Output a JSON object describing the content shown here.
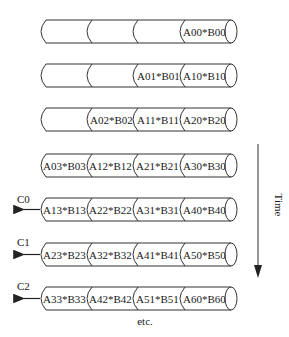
{
  "diagram": {
    "title": "",
    "rows": [
      {
        "output": "",
        "segments": [
          "",
          "",
          "",
          "A00*B00"
        ]
      },
      {
        "output": "",
        "segments": [
          "",
          "",
          "A01*B01",
          "A10*B10"
        ]
      },
      {
        "output": "",
        "segments": [
          "",
          "A02*B02",
          "A11*B11",
          "A20*B20"
        ]
      },
      {
        "output": "",
        "segments": [
          "A03*B03",
          "A12*B12",
          "A21*B21",
          "A30*B30"
        ]
      },
      {
        "output": "C0",
        "segments": [
          "A13*B13",
          "A22*B22",
          "A31*B31",
          "A40*B40"
        ]
      },
      {
        "output": "C1",
        "segments": [
          "A23*B23",
          "A32*B32",
          "A41*B41",
          "A50*B50"
        ]
      },
      {
        "output": "C2",
        "segments": [
          "A33*B33",
          "A42*B42",
          "A51*B51",
          "A60*B60"
        ]
      }
    ],
    "footer": "etc.",
    "time_axis": {
      "label": "Time",
      "direction": "down"
    },
    "colors": {
      "stroke": "#333333",
      "text": "#1a1a1a",
      "background": "#ffffff"
    }
  }
}
